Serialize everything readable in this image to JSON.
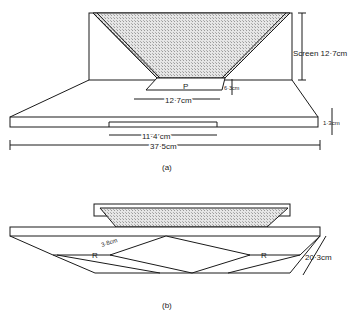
{
  "figure_a": {
    "caption": "(a)",
    "labels": {
      "screen": "Screen 12·7cm",
      "p": "P",
      "p_width": "12·7cm",
      "p_height": "6·3cm",
      "base_thickness": "1·3cm",
      "notch_width": "11·4 cm",
      "total_width": "37·5cm"
    }
  },
  "figure_b": {
    "caption": "(b)",
    "labels": {
      "r_left": "R",
      "r_right": "R",
      "gap": "3·8cm",
      "depth": "20·3cm"
    }
  },
  "colors": {
    "line": "#1a1a1a",
    "screen_fill": "#cfcfcf"
  }
}
